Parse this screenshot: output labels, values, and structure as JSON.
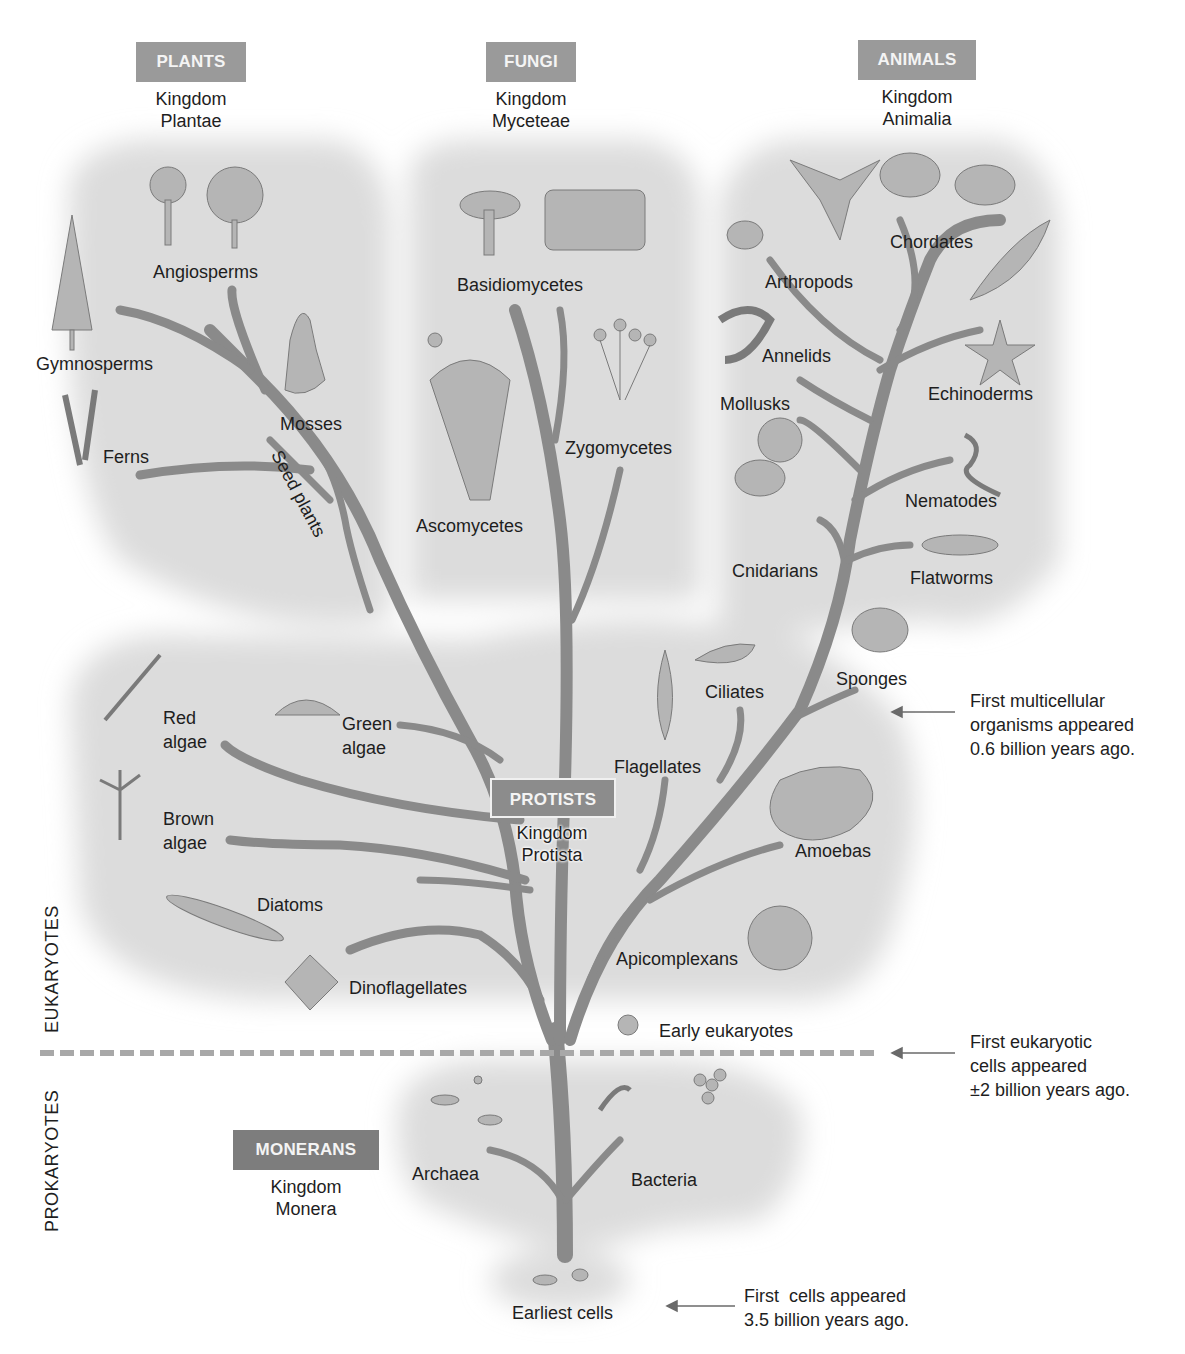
{
  "kingdoms": {
    "plants": {
      "badge": "PLANTS",
      "line1": "Kingdom",
      "line2": "Plantae"
    },
    "fungi": {
      "badge": "FUNGI",
      "line1": "Kingdom",
      "line2": "Myceteae"
    },
    "animals": {
      "badge": "ANIMALS",
      "line1": "Kingdom",
      "line2": "Animalia"
    },
    "protists": {
      "badge": "PROTISTS",
      "line1": "Kingdom",
      "line2": "Protista"
    },
    "monerans": {
      "badge": "MONERANS",
      "line1": "Kingdom",
      "line2": "Monera"
    }
  },
  "groups": {
    "plants": [
      "Angiosperms",
      "Gymnosperms",
      "Mosses",
      "Ferns",
      "Seed plants"
    ],
    "fungi": [
      "Basidiomycetes",
      "Zygomycetes",
      "Ascomycetes"
    ],
    "animals": [
      "Chordates",
      "Arthropods",
      "Annelids",
      "Echinoderms",
      "Mollusks",
      "Nematodes",
      "Cnidarians",
      "Flatworms",
      "Sponges"
    ],
    "protists": [
      "Red",
      "algae",
      "Green",
      "algae",
      "Brown",
      "algae",
      "Diatoms",
      "Dinoflagellates",
      "Flagellates",
      "Ciliates",
      "Amoebas",
      "Apicomplexans"
    ],
    "other": [
      "Early eukaryotes",
      "Archaea",
      "Bacteria",
      "Earliest cells"
    ]
  },
  "domains": {
    "eukaryotes": "EUKARYOTES",
    "prokaryotes": "PROKARYOTES"
  },
  "milestones": [
    {
      "text": "First multicellular\norganisms appeared\n0.6 billion years ago."
    },
    {
      "text": "First eukaryotic\ncells appeared\n±2 billion years ago."
    },
    {
      "text": "First  cells appeared\n3.5 billion years ago."
    }
  ],
  "colors": {
    "branch": "#8a8a8a",
    "badge": "#9a9a9a",
    "region": "#dcdcdc",
    "divider": "#a8a8a8",
    "text": "#1e1e1e"
  }
}
